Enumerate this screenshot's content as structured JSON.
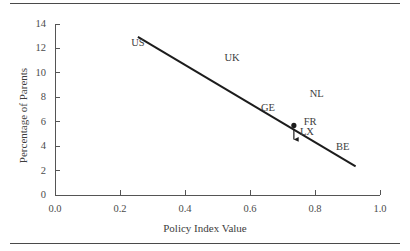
{
  "chart_data": {
    "type": "scatter",
    "title": "",
    "xlabel": "Policy Index Value",
    "ylabel": "Percentage of Parents",
    "xlim": [
      0.0,
      1.0
    ],
    "ylim": [
      0,
      14
    ],
    "xticks": [
      "0.0",
      "0.2",
      "0.4",
      "0.6",
      "0.8",
      "1.0"
    ],
    "xtick_values": [
      0.0,
      0.2,
      0.4,
      0.6,
      0.8,
      1.0
    ],
    "yticks": [
      "0",
      "2",
      "4",
      "6",
      "8",
      "10",
      "12",
      "14"
    ],
    "ytick_values": [
      0,
      2,
      4,
      6,
      8,
      10,
      12,
      14
    ],
    "grid": false,
    "legend": null,
    "annotations": [
      {
        "label": "US",
        "x": 0.255,
        "y": 12.45
      },
      {
        "label": "UK",
        "x": 0.545,
        "y": 11.25
      },
      {
        "label": "GE",
        "x": 0.655,
        "y": 7.15
      },
      {
        "label": "NL",
        "x": 0.805,
        "y": 8.25
      },
      {
        "label": "FR",
        "x": 0.785,
        "y": 5.95
      },
      {
        "label": "LX",
        "x": 0.775,
        "y": 5.15
      },
      {
        "label": "BE",
        "x": 0.885,
        "y": 3.95
      }
    ],
    "points": [
      {
        "label": "BE",
        "x": 0.735,
        "y": 5.7,
        "marker": "dot"
      }
    ],
    "arrows": [
      {
        "from_x": 0.735,
        "from_y": 5.45,
        "to_x": 0.735,
        "to_y": 4.55,
        "points_to": "BE"
      }
    ],
    "trend_line": {
      "x_start": 0.255,
      "y_start": 12.95,
      "x_end": 0.925,
      "y_end": 2.35,
      "color": "#1c1c1c"
    }
  },
  "axes": {
    "line_color": "#555555",
    "text_color": "#3d3d3d"
  }
}
